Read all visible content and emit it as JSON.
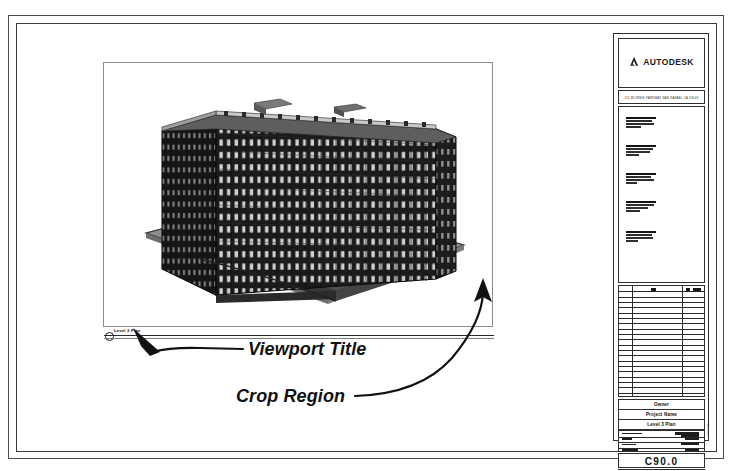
{
  "sheet": {
    "background_color": "#ffffff",
    "border_color": "#3a3a3a"
  },
  "viewport": {
    "crop_region_label": "crop-region-boundary",
    "title_tag": {
      "number": "1",
      "text": "Level 3 Plan",
      "scale": "1/8\" = 1'-0\""
    }
  },
  "model": {
    "description": "3D isometric view of multi-story office building on site pad",
    "building_color": "#1c1c1c",
    "site_color": "#8f8f8f",
    "floors": 10,
    "window_bays": 14
  },
  "annotations": [
    {
      "id": "viewport-title",
      "label": "Viewport Title"
    },
    {
      "id": "crop-region",
      "label": "Crop Region"
    }
  ],
  "annotation_labels": {
    "viewport_title": "Viewport Title",
    "crop_region": "Crop Region"
  },
  "title_block": {
    "logo": {
      "mark": "autodesk-triangle-icon",
      "wordmark": "AUTODESK"
    },
    "address_line": "111 MCINNIS PARKWAY SAN RAFAEL CA 94903",
    "notes_heading": "GENERAL NOTES",
    "note_groups": [
      [
        "NOTE",
        "line",
        "line",
        "line"
      ],
      [
        "NOTE",
        "line",
        "line",
        "line"
      ],
      [
        "NOTE",
        "line",
        "line",
        "line"
      ],
      [
        "NOTE",
        "line",
        "line",
        "line"
      ],
      [
        "NOTE",
        "line",
        "line",
        "line"
      ]
    ],
    "revision_table": {
      "columns": [
        "No.",
        "Description",
        "Date"
      ],
      "row_count": 21
    },
    "owner": "Owner",
    "project_name": "Project Name",
    "sheet_name": "Level 3 Plan",
    "meta_rows": [
      {
        "label": "Project number",
        "value": "Project Number"
      },
      {
        "label": "Date",
        "value": "Date"
      },
      {
        "label": "Drawn by",
        "value": "Author"
      },
      {
        "label": "Checked by",
        "value": "Checker"
      }
    ],
    "scale_label": "Scale",
    "sheet_number": "C90.0",
    "side_text": "A101"
  }
}
